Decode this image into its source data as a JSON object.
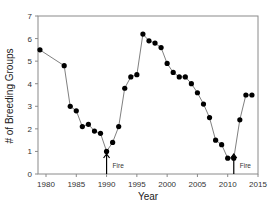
{
  "chart_data": {
    "type": "line",
    "title": "",
    "xlabel": "Year",
    "ylabel": "# of Breeding Groups",
    "xlim": [
      1977,
      2015
    ],
    "ylim": [
      0,
      7
    ],
    "x_ticks": [
      1980,
      1985,
      1990,
      1995,
      2000,
      2005,
      2010,
      2015
    ],
    "y_ticks": [
      0,
      1,
      2,
      3,
      4,
      5,
      6,
      7
    ],
    "grid": false,
    "legend": null,
    "series": [
      {
        "name": "Breeding Groups",
        "marker": "circle",
        "color": "#000000",
        "line_color": "#808080",
        "x": [
          1979,
          1983,
          1984,
          1985,
          1986,
          1987,
          1988,
          1989,
          1990,
          1991,
          1992,
          1993,
          1994,
          1995,
          1996,
          1997,
          1998,
          1999,
          2000,
          2001,
          2002,
          2003,
          2004,
          2005,
          2006,
          2007,
          2008,
          2009,
          2010,
          2011,
          2012,
          2013,
          2014
        ],
        "values": [
          5.5,
          4.8,
          3.0,
          2.8,
          2.1,
          2.2,
          1.9,
          1.8,
          1.0,
          1.4,
          2.1,
          3.8,
          4.3,
          4.4,
          6.2,
          5.9,
          5.8,
          5.6,
          4.9,
          4.5,
          4.3,
          4.3,
          4.0,
          3.6,
          3.1,
          2.5,
          1.5,
          1.3,
          0.7,
          0.7,
          2.4,
          3.5,
          3.5
        ]
      }
    ],
    "annotations": [
      {
        "label": "Fire",
        "x": 1990,
        "type": "arrow-up"
      },
      {
        "label": "Fire",
        "x": 2011,
        "type": "arrow-up"
      }
    ]
  }
}
